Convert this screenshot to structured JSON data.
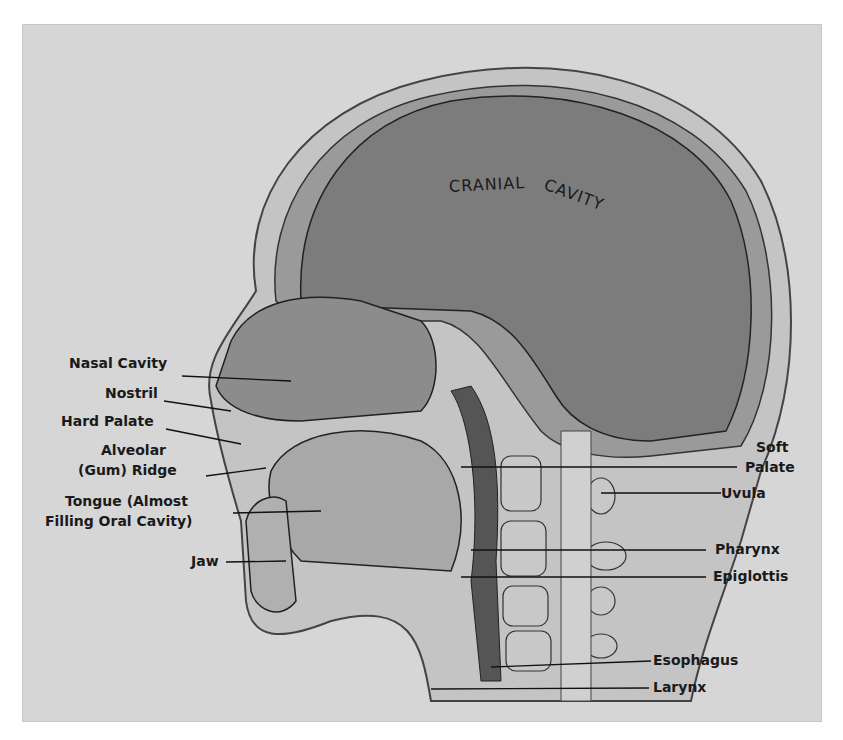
{
  "labels": {
    "cranial_cavity": {
      "part1": "CRANIAL",
      "part2": "CAVITY"
    },
    "left": [
      {
        "id": "nasal-cavity",
        "text": "Nasal Cavity"
      },
      {
        "id": "nostril",
        "text": "Nostril"
      },
      {
        "id": "hard-palate",
        "text": "Hard Palate"
      },
      {
        "id": "alveolar-1",
        "text": "Alveolar"
      },
      {
        "id": "alveolar-2",
        "text": "(Gum) Ridge"
      },
      {
        "id": "tongue-1",
        "text": "Tongue (Almost"
      },
      {
        "id": "tongue-2",
        "text": "Filling Oral Cavity)"
      },
      {
        "id": "jaw",
        "text": "Jaw"
      }
    ],
    "right": [
      {
        "id": "soft-palate-1",
        "text": "Soft"
      },
      {
        "id": "soft-palate-2",
        "text": "Palate"
      },
      {
        "id": "uvula",
        "text": "Uvula"
      },
      {
        "id": "pharynx",
        "text": "Pharynx"
      },
      {
        "id": "epiglottis",
        "text": "Epiglottis"
      },
      {
        "id": "esophagus",
        "text": "Esophagus"
      },
      {
        "id": "larynx",
        "text": "Larynx"
      }
    ]
  },
  "colors": {
    "background": "#d6d6d6",
    "skull": "#8a8a8a",
    "cavity": "#7a7a7a",
    "text": "#1a1a1a"
  }
}
